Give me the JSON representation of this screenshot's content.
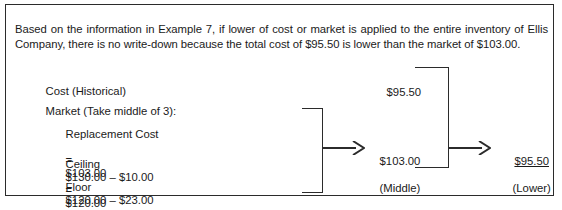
{
  "figure": {
    "intro_paragraph": "Based on the information in Example 7, if lower of cost or market is applied to the entire inventory of Ellis Company, there is no write-down because the total cost of $95.50 is lower than the market of $103.00.",
    "rows": {
      "cost": {
        "label": "Cost (Historical)"
      },
      "market": {
        "label": "Market (Take middle of 3):"
      },
      "replacement": {
        "label": "Replacement Cost",
        "expression": "",
        "equals": "=",
        "amount": "$103.00"
      },
      "ceiling": {
        "label": "Ceiling",
        "expression": "$130.00 – $10.00",
        "equals": "=",
        "amount": "$120.00"
      },
      "floor": {
        "label": "Floor",
        "expression": "$120.00 – $23.00",
        "equals": "=",
        "amount": "$  97.00"
      }
    },
    "flow": {
      "cost_value": "$95.50",
      "middle_amount": "$103.00",
      "middle_caption": "(Middle)",
      "lower_amount": "$95.50",
      "lower_caption": "(Lower)"
    },
    "colors": {
      "border": "#2b2b2b",
      "text": "#1a1a1a",
      "background": "#ffffff"
    }
  }
}
